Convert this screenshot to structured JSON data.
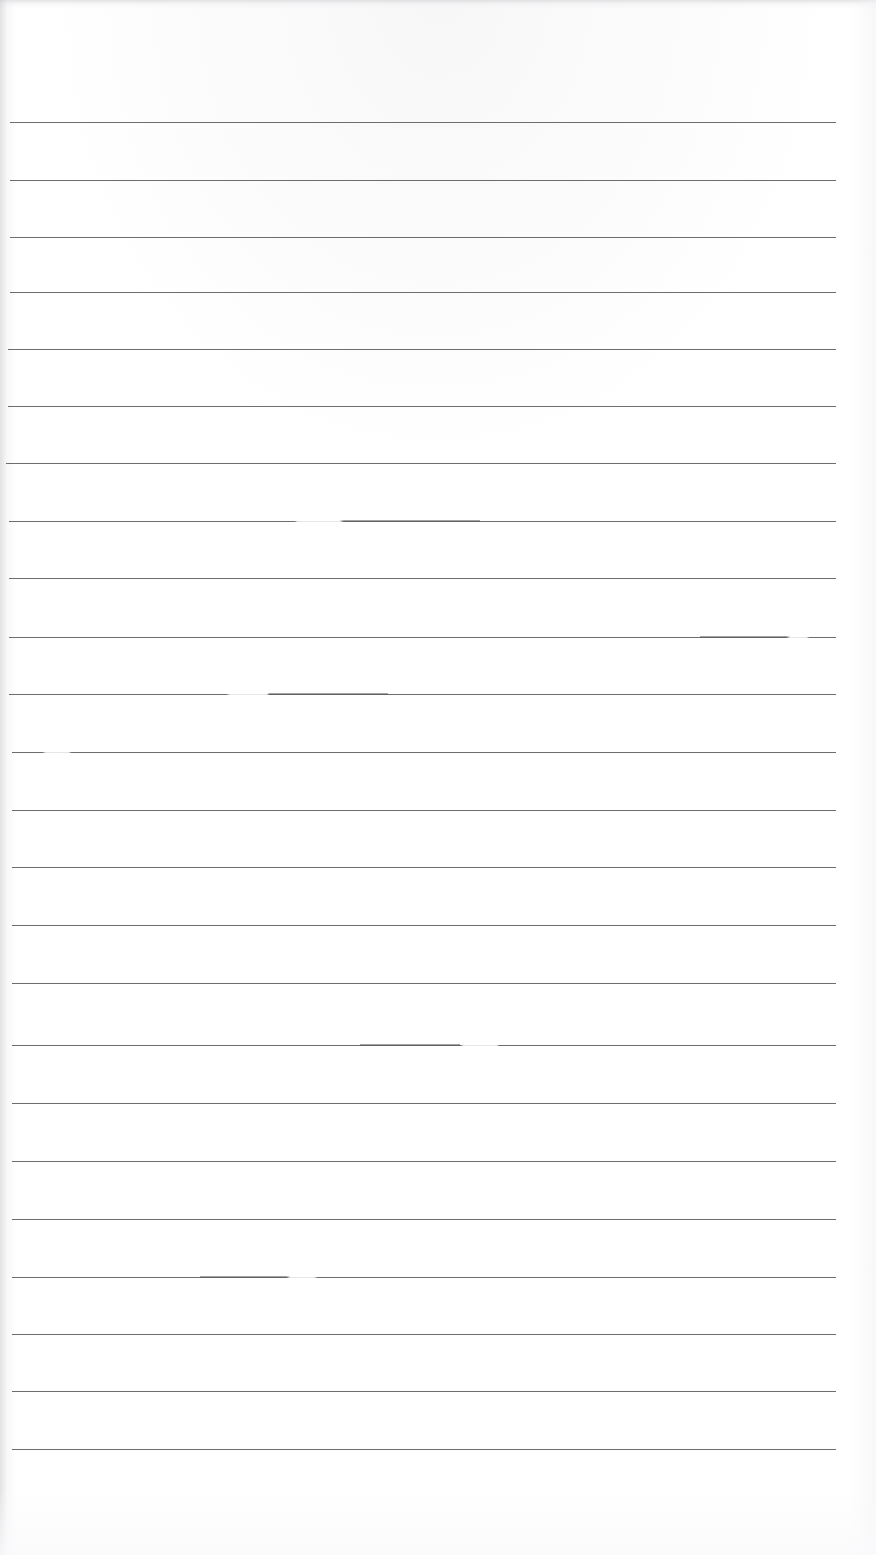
{
  "document": {
    "kind": "scanned-blank-lined-page",
    "title": "Scanned lined notebook page",
    "description": "A blank, ruled sheet of paper captured by a flatbed scanner. No handwriting or printed text is present.",
    "text_content": "",
    "page_width": 876,
    "page_height": 1555,
    "background_color": "#ffffff",
    "rule_color": "#6d6d70",
    "rule_thickness": 1,
    "rule_count": 24,
    "rule_left_x": 10,
    "rule_right_x": 836,
    "first_rule_y": 122,
    "rule_spacing": 57.6,
    "top_margin_note": "blank unruled header band above the first rule",
    "bottom_margin_note": "blank unruled footer band below the last rule"
  },
  "rules": [
    {
      "index": 1,
      "y": 122,
      "x1": 10,
      "x2": 836
    },
    {
      "index": 2,
      "y": 180,
      "x1": 10,
      "x2": 836
    },
    {
      "index": 3,
      "y": 237,
      "x1": 10,
      "x2": 836
    },
    {
      "index": 4,
      "y": 292,
      "x1": 10,
      "x2": 836
    },
    {
      "index": 5,
      "y": 349,
      "x1": 8,
      "x2": 836
    },
    {
      "index": 6,
      "y": 406,
      "x1": 8,
      "x2": 836
    },
    {
      "index": 7,
      "y": 463,
      "x1": 6,
      "x2": 836
    },
    {
      "index": 8,
      "y": 521,
      "x1": 9,
      "x2": 836
    },
    {
      "index": 9,
      "y": 578,
      "x1": 9,
      "x2": 836
    },
    {
      "index": 10,
      "y": 637,
      "x1": 9,
      "x2": 836
    },
    {
      "index": 11,
      "y": 694,
      "x1": 9,
      "x2": 836
    },
    {
      "index": 12,
      "y": 752,
      "x1": 12,
      "x2": 836
    },
    {
      "index": 13,
      "y": 810,
      "x1": 12,
      "x2": 836
    },
    {
      "index": 14,
      "y": 867,
      "x1": 12,
      "x2": 836
    },
    {
      "index": 15,
      "y": 925,
      "x1": 12,
      "x2": 836
    },
    {
      "index": 16,
      "y": 983,
      "x1": 12,
      "x2": 836
    },
    {
      "index": 17,
      "y": 1045,
      "x1": 12,
      "x2": 836
    },
    {
      "index": 18,
      "y": 1103,
      "x1": 12,
      "x2": 836
    },
    {
      "index": 19,
      "y": 1161,
      "x1": 12,
      "x2": 836
    },
    {
      "index": 20,
      "y": 1219,
      "x1": 12,
      "x2": 836
    },
    {
      "index": 21,
      "y": 1277,
      "x1": 12,
      "x2": 836
    },
    {
      "index": 22,
      "y": 1334,
      "x1": 12,
      "x2": 836
    },
    {
      "index": 23,
      "y": 1391,
      "x1": 12,
      "x2": 836
    },
    {
      "index": 24,
      "y": 1449,
      "x1": 12,
      "x2": 836
    }
  ],
  "scan_artifacts": {
    "description": "Faded dropouts and darker re-exposure blots along some ruled lines, plus soft shadow gutters at the page edges.",
    "dropouts": [
      {
        "y": 521,
        "x": 296,
        "width": 46
      },
      {
        "y": 637,
        "x": 788,
        "width": 20
      },
      {
        "y": 694,
        "x": 228,
        "width": 40
      },
      {
        "y": 752,
        "x": 44,
        "width": 26
      },
      {
        "y": 1045,
        "x": 462,
        "width": 36
      },
      {
        "y": 1277,
        "x": 288,
        "width": 28
      },
      {
        "y": 1334,
        "x": 900,
        "width": 0
      }
    ],
    "blots": [
      {
        "y": 520,
        "x": 340,
        "width": 140
      },
      {
        "y": 636,
        "x": 700,
        "width": 90
      },
      {
        "y": 693,
        "x": 268,
        "width": 120
      },
      {
        "y": 1044,
        "x": 360,
        "width": 100
      },
      {
        "y": 1276,
        "x": 200,
        "width": 90
      }
    ]
  }
}
